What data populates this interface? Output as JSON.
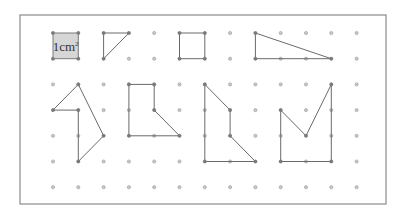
{
  "diagram": {
    "title": "",
    "grid": {
      "columns_x": [
        53,
        78.3,
        103.6,
        128.9,
        154.2,
        179.5,
        204.8,
        230.1,
        255.4,
        280.7,
        306,
        331.3,
        356.6
      ],
      "rows_y": [
        33,
        58.7,
        84.4,
        110.1,
        135.8,
        161.5,
        187.2
      ],
      "dot_color": "#c8c8c8"
    },
    "frame": {
      "x": 20,
      "y": 15,
      "width": 366,
      "height": 189,
      "stroke": "#8a8a8a"
    },
    "unit_square": {
      "label": "1cm",
      "label_superscript": "2",
      "fill": "#d6d6d6",
      "points": [
        [
          0,
          0
        ],
        [
          1,
          0
        ],
        [
          1,
          1
        ],
        [
          0,
          1
        ]
      ]
    },
    "shapes": [
      {
        "name": "small-triangle",
        "points": [
          [
            2,
            0
          ],
          [
            3,
            0
          ],
          [
            2,
            1
          ]
        ]
      },
      {
        "name": "unit-square-outline",
        "points": [
          [
            5,
            0
          ],
          [
            6,
            0
          ],
          [
            6,
            1
          ],
          [
            5,
            1
          ]
        ]
      },
      {
        "name": "right-triangle",
        "points": [
          [
            8,
            0
          ],
          [
            11,
            1
          ],
          [
            8,
            1
          ]
        ]
      },
      {
        "name": "arrow-shape",
        "points": [
          [
            1,
            2
          ],
          [
            2,
            4
          ],
          [
            1,
            5
          ],
          [
            1,
            3
          ],
          [
            0,
            3
          ]
        ]
      },
      {
        "name": "boot-shape",
        "points": [
          [
            3,
            2
          ],
          [
            4,
            2
          ],
          [
            4,
            3
          ],
          [
            5,
            4
          ],
          [
            3,
            4
          ]
        ]
      },
      {
        "name": "l-slant-shape",
        "points": [
          [
            6,
            2
          ],
          [
            7,
            3
          ],
          [
            7,
            4
          ],
          [
            8,
            5
          ],
          [
            6,
            5
          ]
        ]
      },
      {
        "name": "notched-shape",
        "points": [
          [
            9,
            3
          ],
          [
            10,
            4
          ],
          [
            11,
            2
          ],
          [
            11,
            5
          ],
          [
            9,
            5
          ]
        ]
      }
    ]
  }
}
